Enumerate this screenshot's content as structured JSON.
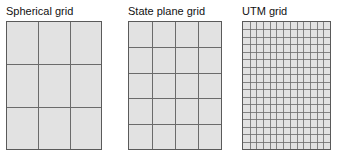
{
  "figure": {
    "background_color": "#ffffff",
    "panel_fill_color": "#e2e2e2",
    "panel_border_color": "#5a5a5a",
    "grid_line_color": "#6b6b6b",
    "title_color": "#111111"
  },
  "panels": [
    {
      "id": "spherical",
      "title": "Spherical grid",
      "columns": 3,
      "rows": 3
    },
    {
      "id": "stateplane",
      "title": "State plane grid",
      "columns": 4,
      "rows": 5
    },
    {
      "id": "utm",
      "title": "UTM grid",
      "columns": 13,
      "rows": 17
    }
  ]
}
